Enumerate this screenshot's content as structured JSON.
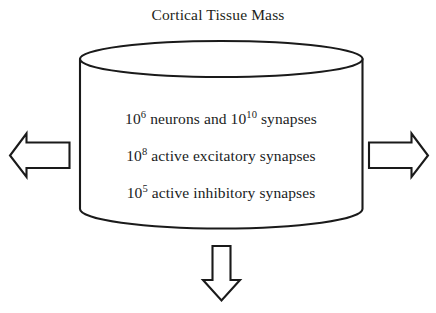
{
  "diagram": {
    "title": "Cortical Tissue Mass",
    "shape": {
      "name": "cylinder",
      "stroke_color": "#1a1a1a",
      "fill_color": "#ffffff",
      "stroke_width": 2
    },
    "lines": [
      {
        "prefix": "10",
        "exp1": "6",
        "mid": " neurons and 10",
        "exp2": "10",
        "suffix": " synapses"
      },
      {
        "prefix": "10",
        "exp1": "8",
        "mid": " active excitatory synapses",
        "exp2": "",
        "suffix": ""
      },
      {
        "prefix": "10",
        "exp1": "5",
        "mid": " active inhibitory synapses",
        "exp2": "",
        "suffix": ""
      }
    ],
    "line_texts": [
      "10^6 neurons and 10^10 synapses",
      "10^8 active excitatory synapses",
      "10^5 active inhibitory synapses"
    ],
    "arrows": [
      {
        "name": "left-arrow",
        "direction": "left"
      },
      {
        "name": "right-arrow",
        "direction": "right"
      },
      {
        "name": "down-arrow",
        "direction": "down"
      }
    ],
    "background_color": "#ffffff"
  }
}
